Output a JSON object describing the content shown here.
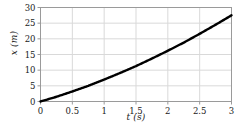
{
  "chart_data": {
    "type": "line",
    "title": "",
    "xlabel": "t (s)",
    "ylabel": "x (m)",
    "xlim": [
      0,
      3
    ],
    "ylim": [
      0,
      30
    ],
    "xticks": [
      "0",
      "0.5",
      "1",
      "1.5",
      "2",
      "2.5",
      "3"
    ],
    "xtick_values": [
      0,
      0.5,
      1,
      1.5,
      2,
      2.5,
      3
    ],
    "yticks": [
      "0",
      "5",
      "10",
      "15",
      "20",
      "25",
      "30"
    ],
    "ytick_values": [
      0,
      5,
      10,
      15,
      20,
      25,
      30
    ],
    "grid": true,
    "legend": null,
    "series": [
      {
        "name": "position",
        "x": [
          0,
          0.25,
          0.5,
          0.75,
          1,
          1.25,
          1.5,
          1.75,
          2,
          2.25,
          2.5,
          2.75,
          3
        ],
        "values": [
          0,
          1.5,
          3.2,
          5.0,
          7.0,
          9.1,
          11.3,
          13.7,
          16.2,
          18.8,
          21.6,
          24.5,
          27.5
        ]
      }
    ],
    "colors": {
      "curve": "#000000",
      "grid": "#d9d9d9",
      "frame": "#9a9a9a",
      "text": "#1a1a1a",
      "background": "#ffffff"
    }
  }
}
